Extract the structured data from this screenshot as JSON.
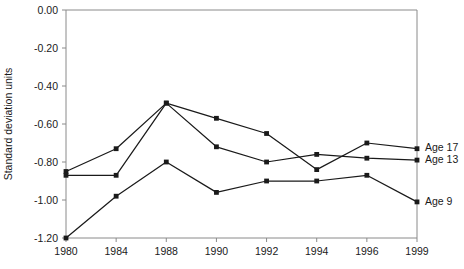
{
  "chart_data": {
    "type": "line",
    "title": "",
    "subtitle": "",
    "xlabel": "",
    "ylabel": "Standard deviation units",
    "categories": [
      "1980",
      "1984",
      "1988",
      "1990",
      "1992",
      "1994",
      "1996",
      "1999"
    ],
    "ylim": [
      -1.2,
      0.0
    ],
    "yticks": [
      0.0,
      -0.2,
      -0.4,
      -0.6,
      -0.8,
      -1.0,
      -1.2
    ],
    "ytick_labels": [
      "0.00",
      "-0.20",
      "-0.40",
      "-0.60",
      "-0.80",
      "-1.00",
      "-1.20"
    ],
    "grid": false,
    "legend_position": "right-inline",
    "marker": "square",
    "series": [
      {
        "name": "Age 17",
        "label": "Age 17",
        "color": "#1a1a1a",
        "values": [
          -0.85,
          -0.73,
          -0.49,
          -0.57,
          -0.65,
          -0.84,
          -0.7,
          -0.73
        ]
      },
      {
        "name": "Age 13",
        "label": "Age 13",
        "color": "#1a1a1a",
        "values": [
          -0.87,
          -0.87,
          -0.49,
          -0.72,
          -0.8,
          -0.76,
          -0.78,
          -0.79
        ]
      },
      {
        "name": "Age 9",
        "label": "Age 9",
        "color": "#1a1a1a",
        "values": [
          -1.2,
          -0.98,
          -0.8,
          -0.96,
          -0.9,
          -0.9,
          -0.87,
          -1.01
        ]
      }
    ]
  },
  "caption": {
    "text": ""
  }
}
